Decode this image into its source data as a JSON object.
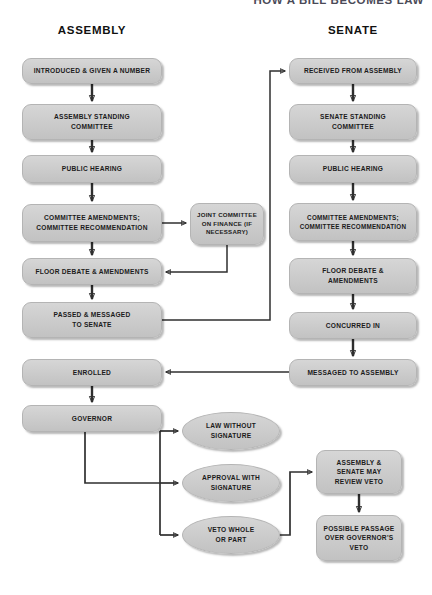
{
  "title": "HOW A BILL BECOMES LAW",
  "columns": {
    "left": "ASSEMBLY",
    "right": "SENATE"
  },
  "diagram": {
    "type": "flowchart",
    "orientation": "two-column-vertical",
    "nodes": [
      {
        "id": "introduced",
        "label": "INTRODUCED & GIVEN A NUMBER",
        "shape": "rounded-rect",
        "column": "assembly",
        "x": 22,
        "y": 58,
        "w": 140,
        "h": 26
      },
      {
        "id": "asm-standing",
        "label": "ASSEMBLY STANDING\nCOMMITTEE",
        "shape": "rounded-rect",
        "column": "assembly",
        "x": 22,
        "y": 104,
        "w": 140,
        "h": 36
      },
      {
        "id": "asm-hearing",
        "label": "PUBLIC HEARING",
        "shape": "rounded-rect",
        "column": "assembly",
        "x": 22,
        "y": 155,
        "w": 140,
        "h": 28
      },
      {
        "id": "asm-amend",
        "label": "COMMITTEE AMENDMENTS;\nCOMMITTEE RECOMMENDATION",
        "shape": "rounded-rect",
        "column": "assembly",
        "x": 22,
        "y": 204,
        "w": 140,
        "h": 38
      },
      {
        "id": "joint-finance",
        "label": "JOINT COMMITTEE\nON FINANCE (IF\nNECESSARY)",
        "shape": "rounded-rect",
        "column": "middle",
        "x": 190,
        "y": 203,
        "w": 74,
        "h": 42
      },
      {
        "id": "asm-floor",
        "label": "FLOOR DEBATE & AMENDMENTS",
        "shape": "rounded-rect",
        "column": "assembly",
        "x": 22,
        "y": 258,
        "w": 140,
        "h": 27
      },
      {
        "id": "passed-senate",
        "label": "PASSED & MESSAGED\nTO SENATE",
        "shape": "rounded-rect",
        "column": "assembly",
        "x": 22,
        "y": 302,
        "w": 140,
        "h": 36
      },
      {
        "id": "enrolled",
        "label": "ENROLLED",
        "shape": "rounded-rect",
        "column": "assembly",
        "x": 22,
        "y": 359,
        "w": 140,
        "h": 27
      },
      {
        "id": "governor",
        "label": "GOVERNOR",
        "shape": "rounded-rect",
        "column": "assembly",
        "x": 22,
        "y": 405,
        "w": 140,
        "h": 27
      },
      {
        "id": "sen-received",
        "label": "RECEIVED FROM ASSEMBLY",
        "shape": "rounded-rect",
        "column": "senate",
        "x": 289,
        "y": 58,
        "w": 128,
        "h": 26
      },
      {
        "id": "sen-standing",
        "label": "SENATE STANDING\nCOMMITTEE",
        "shape": "rounded-rect",
        "column": "senate",
        "x": 289,
        "y": 104,
        "w": 128,
        "h": 36
      },
      {
        "id": "sen-hearing",
        "label": "PUBLIC HEARING",
        "shape": "rounded-rect",
        "column": "senate",
        "x": 289,
        "y": 155,
        "w": 128,
        "h": 28
      },
      {
        "id": "sen-amend",
        "label": "COMMITTEE AMENDMENTS;\nCOMMITTEE RECOMMENDATION",
        "shape": "rounded-rect",
        "column": "senate",
        "x": 289,
        "y": 203,
        "w": 128,
        "h": 38
      },
      {
        "id": "sen-floor",
        "label": "FLOOR DEBATE &\nAMENDMENTS",
        "shape": "rounded-rect",
        "column": "senate",
        "x": 289,
        "y": 258,
        "w": 128,
        "h": 36
      },
      {
        "id": "concurred",
        "label": "CONCURRED IN",
        "shape": "rounded-rect",
        "column": "senate",
        "x": 289,
        "y": 312,
        "w": 128,
        "h": 27
      },
      {
        "id": "msg-assembly",
        "label": "MESSAGED TO ASSEMBLY",
        "shape": "rounded-rect",
        "column": "senate",
        "x": 289,
        "y": 359,
        "w": 128,
        "h": 27
      },
      {
        "id": "law-no-sig",
        "label": "LAW WITHOUT\nSIGNATURE",
        "shape": "oval",
        "column": "governor-branch",
        "x": 182,
        "y": 412,
        "w": 98,
        "h": 38
      },
      {
        "id": "approval-sig",
        "label": "APPROVAL WITH\nSIGNATURE",
        "shape": "oval",
        "column": "governor-branch",
        "x": 182,
        "y": 464,
        "w": 98,
        "h": 38
      },
      {
        "id": "veto",
        "label": "VETO WHOLE\nOR PART",
        "shape": "oval",
        "column": "governor-branch",
        "x": 182,
        "y": 516,
        "w": 98,
        "h": 38
      },
      {
        "id": "review-veto",
        "label": "ASSEMBLY &\nSENATE MAY\nREVIEW VETO",
        "shape": "rounded-rect",
        "column": "veto-branch",
        "x": 316,
        "y": 450,
        "w": 86,
        "h": 44
      },
      {
        "id": "possible-passage",
        "label": "POSSIBLE PASSAGE\nOVER GOVERNOR'S\nVETO",
        "shape": "rounded-rect",
        "column": "veto-branch",
        "x": 316,
        "y": 515,
        "w": 86,
        "h": 46
      }
    ],
    "edges": [
      {
        "from": "introduced",
        "to": "asm-standing",
        "style": "straight-down"
      },
      {
        "from": "asm-standing",
        "to": "asm-hearing",
        "style": "straight-down"
      },
      {
        "from": "asm-hearing",
        "to": "asm-amend",
        "style": "straight-down"
      },
      {
        "from": "asm-amend",
        "to": "joint-finance",
        "style": "right"
      },
      {
        "from": "asm-amend",
        "to": "asm-floor",
        "style": "straight-down"
      },
      {
        "from": "joint-finance",
        "to": "asm-floor",
        "style": "down-then-left"
      },
      {
        "from": "asm-floor",
        "to": "passed-senate",
        "style": "straight-down"
      },
      {
        "from": "passed-senate",
        "to": "sen-received",
        "style": "right-up-right"
      },
      {
        "from": "sen-received",
        "to": "sen-standing",
        "style": "straight-down"
      },
      {
        "from": "sen-standing",
        "to": "sen-hearing",
        "style": "straight-down"
      },
      {
        "from": "sen-hearing",
        "to": "sen-amend",
        "style": "straight-down"
      },
      {
        "from": "sen-amend",
        "to": "sen-floor",
        "style": "straight-down"
      },
      {
        "from": "sen-floor",
        "to": "concurred",
        "style": "straight-down"
      },
      {
        "from": "concurred",
        "to": "msg-assembly",
        "style": "straight-down"
      },
      {
        "from": "msg-assembly",
        "to": "enrolled",
        "style": "left"
      },
      {
        "from": "enrolled",
        "to": "governor",
        "style": "straight-down"
      },
      {
        "from": "governor",
        "to": "law-no-sig",
        "style": "down-right-branch"
      },
      {
        "from": "governor",
        "to": "approval-sig",
        "style": "down-right-branch"
      },
      {
        "from": "governor",
        "to": "veto",
        "style": "down-right-branch"
      },
      {
        "from": "veto",
        "to": "review-veto",
        "style": "right-up-right"
      },
      {
        "from": "review-veto",
        "to": "possible-passage",
        "style": "straight-down"
      }
    ]
  },
  "colors": {
    "node_fill": "#cdcdcd",
    "node_border": "#b4b4b4",
    "connector": "#2f2f2f",
    "text": "#1b1b1b",
    "background": "#ffffff"
  }
}
